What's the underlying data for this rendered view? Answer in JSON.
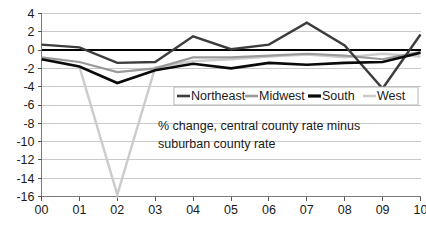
{
  "chart_data": {
    "type": "line",
    "title": "",
    "subtitle": "",
    "annotation": [
      "% change, central county rate minus",
      "suburban county rate"
    ],
    "xlabel": "",
    "ylabel": "",
    "categories": [
      "00",
      "01",
      "02",
      "03",
      "04",
      "05",
      "06",
      "07",
      "08",
      "09",
      "10"
    ],
    "x_tick_labels": [
      "00",
      "01",
      "02",
      "03",
      "04",
      "05",
      "06",
      "07",
      "08",
      "09",
      "10"
    ],
    "y_tick_labels": [
      "4",
      "2",
      "0",
      "-2",
      "-4",
      "-6",
      "-8",
      "-10",
      "-12",
      "-14",
      "-16"
    ],
    "y_tick_values": [
      4,
      2,
      0,
      -2,
      -4,
      -6,
      -8,
      -10,
      -12,
      -14,
      -16
    ],
    "ylim": [
      -16,
      4
    ],
    "xlim": [
      0,
      10
    ],
    "grid": true,
    "grid_axis": "y",
    "legend_position": "inside-upper-right",
    "zero_line": true,
    "series": [
      {
        "name": "Northeast",
        "color": "#3c3c3c",
        "width": 2.4,
        "values": [
          0.6,
          0.3,
          -1.4,
          -1.3,
          1.5,
          0.1,
          0.6,
          3.0,
          0.5,
          -4.2,
          1.7
        ]
      },
      {
        "name": "Midwest",
        "color": "#9a9a9a",
        "width": 2.2,
        "values": [
          -0.8,
          -1.3,
          -2.4,
          -2.0,
          -0.8,
          -0.8,
          -0.6,
          -0.4,
          -0.6,
          -1.0,
          -0.2
        ]
      },
      {
        "name": "South",
        "color": "#0a0a0a",
        "width": 2.6,
        "values": [
          -1.0,
          -1.8,
          -3.6,
          -2.2,
          -1.5,
          -2.0,
          -1.4,
          -1.6,
          -1.4,
          -1.3,
          -0.3
        ]
      },
      {
        "name": "West",
        "color": "#cccccc",
        "width": 2.4,
        "values": [
          -0.9,
          -1.8,
          -15.8,
          -1.9,
          -1.2,
          -1.0,
          -0.7,
          -0.5,
          -0.8,
          -0.4,
          -0.7
        ]
      }
    ]
  },
  "legend": {
    "entries": [
      {
        "label": "Northeast",
        "color": "#3c3c3c"
      },
      {
        "label": "Midwest",
        "color": "#9a9a9a"
      },
      {
        "label": "South",
        "color": "#0a0a0a"
      },
      {
        "label": "West",
        "color": "#cccccc"
      }
    ]
  },
  "colors": {
    "background": "#ffffff",
    "gridline": "#c9c9c9",
    "axis": "#7a7a7a",
    "zero_line": "#000000",
    "text": "#1a1a1a"
  }
}
